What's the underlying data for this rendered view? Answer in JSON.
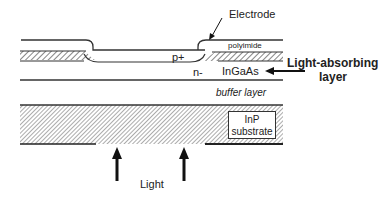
{
  "diagram": {
    "type": "photodiode cross-section",
    "labels": {
      "electrode": "Electrode",
      "polyimide": "polyimide",
      "p_plus": "p+",
      "n_minus": "n-",
      "ingaas": "InGaAs",
      "light_absorbing_line1": "Light-absorbing",
      "light_absorbing_line2": "layer",
      "buffer_layer": "buffer layer",
      "inp": "InP",
      "substrate": "substrate",
      "light": "Light"
    },
    "colors": {
      "line": "#333333",
      "hatch": "#555555",
      "background": "#ffffff"
    }
  }
}
